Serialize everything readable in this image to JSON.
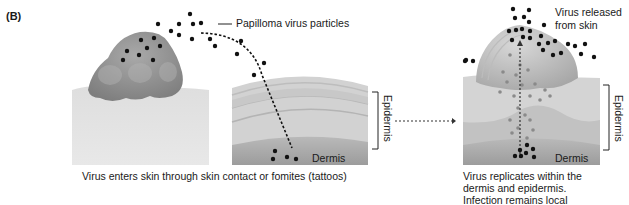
{
  "figure": {
    "panel_label": "(B)",
    "labels": {
      "particles": "Papilloma virus particles",
      "epidermis_left": "Epidermis",
      "dermis_left": "Dermis",
      "released": [
        "Virus released",
        "from skin"
      ],
      "epidermis_right": "Epidermis",
      "dermis_right": "Dermis"
    },
    "captions": {
      "left": "Virus enters skin through skin contact or fomites (tattoos)",
      "right": [
        "Virus replicates within the",
        "dermis and epidermis.",
        "Infection remains local"
      ]
    },
    "colors": {
      "particle": "#111111",
      "wart": "#8f8f8f",
      "skin_light": "#dcdcdc",
      "skin_mid": "#c4c4c4",
      "skin_dark": "#a8a8a8",
      "faded_particle": "#8a8a8a"
    }
  }
}
